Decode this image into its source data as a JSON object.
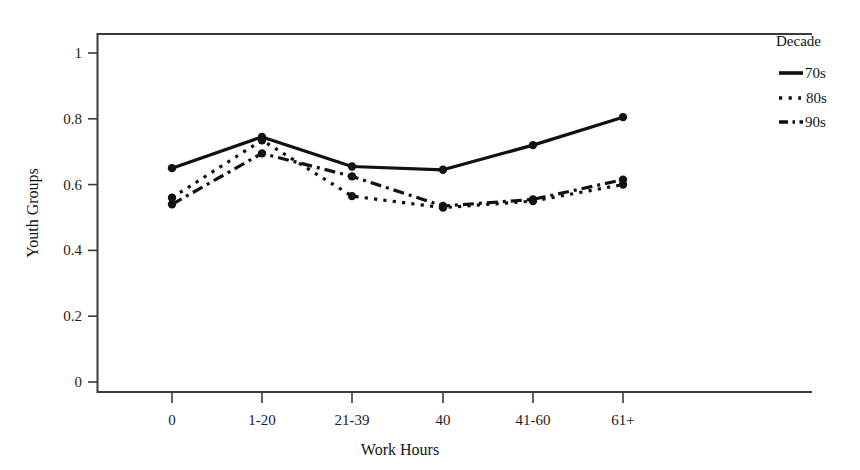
{
  "chart_data": {
    "type": "line",
    "title": "",
    "xlabel": "Work Hours",
    "ylabel": "Youth Groups",
    "categories": [
      "0",
      "1-20",
      "21-39",
      "40",
      "41-60",
      "61+"
    ],
    "ylim": [
      0,
      1
    ],
    "yticks": [
      "0",
      "0.2",
      "0.4",
      "0.6",
      "0.8",
      "1"
    ],
    "ytick_values": [
      0,
      0.2,
      0.4,
      0.6,
      0.8,
      1
    ],
    "grid": false,
    "legend_position": "right",
    "legend_title": "Decade",
    "series": [
      {
        "name": "70s",
        "style": "solid",
        "color": "#111111",
        "values": [
          0.65,
          0.745,
          0.655,
          0.645,
          0.72,
          0.805
        ]
      },
      {
        "name": "80s",
        "style": "dotted",
        "color": "#111111",
        "values": [
          0.56,
          0.735,
          0.565,
          0.53,
          0.55,
          0.6
        ]
      },
      {
        "name": "90s",
        "style": "dashed",
        "color": "#111111",
        "values": [
          0.54,
          0.695,
          0.625,
          0.535,
          0.555,
          0.615
        ]
      }
    ]
  },
  "axes": {
    "x_title": "Work Hours",
    "y_title": "Youth Groups",
    "x_tick_labels": [
      "0",
      "1-20",
      "21-39",
      "40",
      "41-60",
      "61+"
    ],
    "y_tick_labels": [
      "1",
      "0.8",
      "0.6",
      "0.4",
      "0.2",
      "0"
    ]
  },
  "legend": {
    "title": "Decade",
    "items": [
      {
        "label": "70s",
        "swatch": "solid-line-swatch"
      },
      {
        "label": "80s",
        "swatch": "dotted-line-swatch"
      },
      {
        "label": "90s",
        "swatch": "dashed-line-swatch"
      }
    ]
  },
  "colors": {
    "ink": "#111111",
    "axis": "#3a3a3a",
    "background": "#ffffff"
  }
}
